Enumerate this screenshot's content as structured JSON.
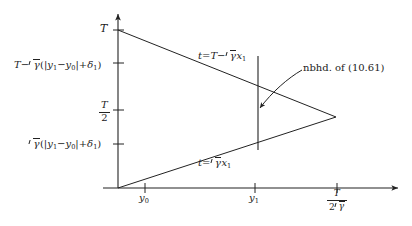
{
  "figure": {
    "background_color": "#ffffff",
    "ink_color": "#222222",
    "axes": {
      "vertical_axis_name": "t-axis",
      "horizontal_axis_name": "x1-axis"
    },
    "y_ticks": [
      {
        "id": "T",
        "label_plain": "T"
      },
      {
        "id": "T-minus",
        "label_plain": "T - sqrt(gamma)(|y1 - y0| + delta1)"
      },
      {
        "id": "T-half",
        "label_plain": "T/2"
      },
      {
        "id": "sqrt-lo",
        "label_plain": "sqrt(gamma)(|y1 - y0| + delta1)"
      }
    ],
    "x_ticks": [
      {
        "id": "y0",
        "label_plain": "y0"
      },
      {
        "id": "y1",
        "label_plain": "y1"
      },
      {
        "id": "T-2sqrt",
        "label_plain": "T / (2 sqrt(gamma))"
      }
    ],
    "line_labels": {
      "upper_plain": "t = T - sqrt(gamma) x1",
      "lower_plain": "t = sqrt(gamma) x1"
    },
    "annotation": {
      "text_prefix": "nbhd.",
      "text_middle": "of",
      "text_reference": "(10.61)"
    },
    "symbols": {
      "T": "T",
      "minus": "−",
      "gamma": "γ",
      "y": "y",
      "x": "x",
      "t": "t",
      "delta": "δ",
      "equals": "=",
      "abs_open": "|",
      "abs_close": "|",
      "paren_open": "(",
      "paren_close": ")",
      "plus": "+",
      "sub_0": "0",
      "sub_1": "1",
      "two": "2"
    }
  }
}
